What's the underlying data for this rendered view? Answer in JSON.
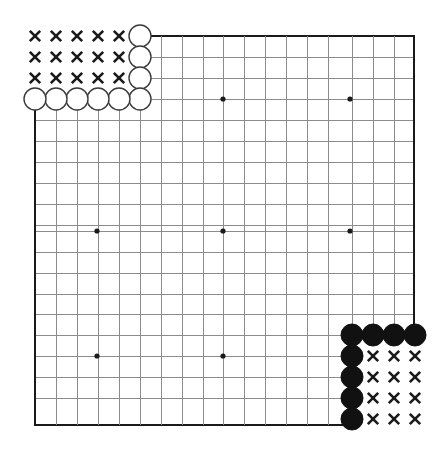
{
  "figure": {
    "kind": "go-board-diagram",
    "board_size": 19,
    "background_color": "#ffffff"
  },
  "geometry": {
    "cell_size": 21,
    "origin_x": 35,
    "origin_y": 36,
    "grid_left_x": 35,
    "grid_right_x": 414,
    "grid_top_y": 36,
    "grid_bottom_y": 425,
    "top_edge_start_x": 140,
    "bottom_edge_end_x": 352,
    "left_edge_start_y": 99,
    "right_edge_end_y": 425
  },
  "colors": {
    "grid_line": "#8c8c8c",
    "edge_line": "#1a1a1a",
    "black_stone": "#111111",
    "white_stone_fill": "#ffffff",
    "white_stone_outline": "#3a3a3a",
    "mark": "#1a1a1a",
    "star_point": "#1a1a1a"
  },
  "star_points": [
    {
      "name": "star-point-top-left",
      "x": 97,
      "y": 99
    },
    {
      "name": "star-point-top-center",
      "x": 223,
      "y": 99
    },
    {
      "name": "star-point-top-right",
      "x": 350,
      "y": 99
    },
    {
      "name": "star-point-middle-left",
      "x": 97,
      "y": 231
    },
    {
      "name": "star-point-tengen",
      "x": 223,
      "y": 231
    },
    {
      "name": "star-point-middle-right",
      "x": 350,
      "y": 231
    },
    {
      "name": "star-point-bottom-left",
      "x": 97,
      "y": 356
    },
    {
      "name": "star-point-bottom-center",
      "x": 223,
      "y": 356
    }
  ],
  "stones": {
    "white": [
      {
        "name": "white-stone-wall-top",
        "x": 140,
        "y": 36,
        "radius": 11
      },
      {
        "name": "white-stone-wall-upper",
        "x": 140,
        "y": 57,
        "radius": 11
      },
      {
        "name": "white-stone-wall-lower",
        "x": 140,
        "y": 78,
        "radius": 11
      },
      {
        "name": "white-stone-row-e",
        "x": 140,
        "y": 99,
        "radius": 11
      },
      {
        "name": "white-stone-row-d",
        "x": 119,
        "y": 99,
        "radius": 11
      },
      {
        "name": "white-stone-row-c",
        "x": 98,
        "y": 99,
        "radius": 11
      },
      {
        "name": "white-stone-row-b",
        "x": 77,
        "y": 99,
        "radius": 11
      },
      {
        "name": "white-stone-row-a",
        "x": 56,
        "y": 99,
        "radius": 11
      },
      {
        "name": "white-stone-row-corner",
        "x": 35,
        "y": 99,
        "radius": 11
      }
    ],
    "black": [
      {
        "name": "black-stone-wall-left",
        "x": 352,
        "y": 335,
        "radius": 11
      },
      {
        "name": "black-stone-wall-mid-left",
        "x": 373,
        "y": 335,
        "radius": 11
      },
      {
        "name": "black-stone-wall-mid-right",
        "x": 394,
        "y": 335,
        "radius": 11
      },
      {
        "name": "black-stone-wall-right",
        "x": 415,
        "y": 335,
        "radius": 11
      },
      {
        "name": "black-stone-col-1",
        "x": 352,
        "y": 356,
        "radius": 11
      },
      {
        "name": "black-stone-col-2",
        "x": 352,
        "y": 377,
        "radius": 11
      },
      {
        "name": "black-stone-col-3",
        "x": 352,
        "y": 398,
        "radius": 11
      },
      {
        "name": "black-stone-col-4",
        "x": 352,
        "y": 419,
        "radius": 11
      }
    ]
  },
  "territory_marks": {
    "glyph": "x",
    "top_left_group": {
      "label": "white-territory-top-left",
      "points": [
        {
          "x": 35,
          "y": 36
        },
        {
          "x": 56,
          "y": 36
        },
        {
          "x": 77,
          "y": 36
        },
        {
          "x": 98,
          "y": 36
        },
        {
          "x": 119,
          "y": 36
        },
        {
          "x": 35,
          "y": 57
        },
        {
          "x": 56,
          "y": 57
        },
        {
          "x": 77,
          "y": 57
        },
        {
          "x": 98,
          "y": 57
        },
        {
          "x": 119,
          "y": 57
        },
        {
          "x": 35,
          "y": 78
        },
        {
          "x": 56,
          "y": 78
        },
        {
          "x": 77,
          "y": 78
        },
        {
          "x": 98,
          "y": 78
        },
        {
          "x": 119,
          "y": 78
        }
      ]
    },
    "bottom_right_group": {
      "label": "black-territory-bottom-right",
      "points": [
        {
          "x": 373,
          "y": 356
        },
        {
          "x": 394,
          "y": 356
        },
        {
          "x": 415,
          "y": 356
        },
        {
          "x": 373,
          "y": 377
        },
        {
          "x": 394,
          "y": 377
        },
        {
          "x": 415,
          "y": 377
        },
        {
          "x": 373,
          "y": 398
        },
        {
          "x": 394,
          "y": 398
        },
        {
          "x": 415,
          "y": 398
        },
        {
          "x": 373,
          "y": 419
        },
        {
          "x": 394,
          "y": 419
        },
        {
          "x": 415,
          "y": 419
        }
      ]
    }
  },
  "grid_lines": {
    "horizontal": [
      {
        "y": 36,
        "x1": 140,
        "x2": 414,
        "weight": "edge"
      },
      {
        "y": 57,
        "x1": 140,
        "x2": 414,
        "weight": "thin"
      },
      {
        "y": 78,
        "x1": 140,
        "x2": 414,
        "weight": "thin"
      },
      {
        "y": 99,
        "x1": 35,
        "x2": 414,
        "weight": "thin"
      },
      {
        "y": 120,
        "x1": 35,
        "x2": 414,
        "weight": "thin"
      },
      {
        "y": 141,
        "x1": 35,
        "x2": 414,
        "weight": "thin"
      },
      {
        "y": 162,
        "x1": 35,
        "x2": 414,
        "weight": "thin"
      },
      {
        "y": 183,
        "x1": 35,
        "x2": 414,
        "weight": "thin"
      },
      {
        "y": 204,
        "x1": 35,
        "x2": 414,
        "weight": "thin"
      },
      {
        "y": 225,
        "x1": 35,
        "x2": 414,
        "weight": "thin"
      },
      {
        "y": 231,
        "x1": 35,
        "x2": 414,
        "weight": "thin"
      },
      {
        "y": 252,
        "x1": 35,
        "x2": 414,
        "weight": "thin"
      },
      {
        "y": 273,
        "x1": 35,
        "x2": 414,
        "weight": "thin"
      },
      {
        "y": 294,
        "x1": 35,
        "x2": 414,
        "weight": "thin"
      },
      {
        "y": 314,
        "x1": 35,
        "x2": 414,
        "weight": "thin"
      },
      {
        "y": 335,
        "x1": 35,
        "x2": 414,
        "weight": "thin"
      },
      {
        "y": 356,
        "x1": 35,
        "x2": 352,
        "weight": "thin"
      },
      {
        "y": 377,
        "x1": 35,
        "x2": 352,
        "weight": "thin"
      },
      {
        "y": 398,
        "x1": 35,
        "x2": 352,
        "weight": "thin"
      },
      {
        "y": 425,
        "x1": 35,
        "x2": 352,
        "weight": "edge"
      }
    ],
    "vertical": [
      {
        "x": 35,
        "y1": 99,
        "y2": 425,
        "weight": "edge"
      },
      {
        "x": 56,
        "y1": 99,
        "y2": 425,
        "weight": "thin"
      },
      {
        "x": 77,
        "y1": 99,
        "y2": 425,
        "weight": "thin"
      },
      {
        "x": 98,
        "y1": 99,
        "y2": 425,
        "weight": "thin"
      },
      {
        "x": 119,
        "y1": 99,
        "y2": 425,
        "weight": "thin"
      },
      {
        "x": 140,
        "y1": 36,
        "y2": 425,
        "weight": "thin"
      },
      {
        "x": 161,
        "y1": 36,
        "y2": 425,
        "weight": "thin"
      },
      {
        "x": 182,
        "y1": 36,
        "y2": 425,
        "weight": "thin"
      },
      {
        "x": 203,
        "y1": 36,
        "y2": 425,
        "weight": "thin"
      },
      {
        "x": 223,
        "y1": 36,
        "y2": 425,
        "weight": "thin"
      },
      {
        "x": 244,
        "y1": 36,
        "y2": 425,
        "weight": "thin"
      },
      {
        "x": 265,
        "y1": 36,
        "y2": 425,
        "weight": "thin"
      },
      {
        "x": 286,
        "y1": 36,
        "y2": 425,
        "weight": "thin"
      },
      {
        "x": 307,
        "y1": 36,
        "y2": 425,
        "weight": "thin"
      },
      {
        "x": 328,
        "y1": 36,
        "y2": 425,
        "weight": "thin"
      },
      {
        "x": 352,
        "y1": 36,
        "y2": 425,
        "weight": "thin"
      },
      {
        "x": 373,
        "y1": 36,
        "y2": 335,
        "weight": "thin"
      },
      {
        "x": 394,
        "y1": 36,
        "y2": 335,
        "weight": "thin"
      },
      {
        "x": 414,
        "y1": 36,
        "y2": 335,
        "weight": "edge"
      }
    ]
  }
}
